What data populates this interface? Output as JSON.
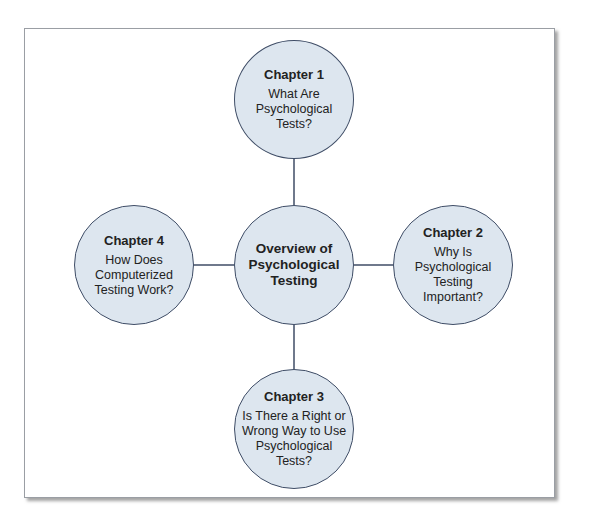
{
  "diagram": {
    "type": "hub-and-spoke concept map",
    "colors": {
      "node_fill": "#dde6ef",
      "node_border": "#3f4d66",
      "connector": "#3f4d66",
      "frame_border": "#9a9ea4",
      "text": "#222222"
    },
    "center": {
      "title": "Overview of\nPsychological\nTesting"
    },
    "nodes": [
      {
        "position": "top",
        "chapter": "Chapter 1",
        "title": "What Are\nPsychological\nTests?"
      },
      {
        "position": "right",
        "chapter": "Chapter 2",
        "title": "Why Is\nPsychological\nTesting\nImportant?"
      },
      {
        "position": "bottom",
        "chapter": "Chapter 3",
        "title": "Is There a Right or\nWrong Way to Use\nPsychological\nTests?"
      },
      {
        "position": "left",
        "chapter": "Chapter 4",
        "title": "How Does\nComputerized\nTesting Work?"
      }
    ],
    "edges": [
      {
        "from": "center",
        "to": "Chapter 1"
      },
      {
        "from": "center",
        "to": "Chapter 2"
      },
      {
        "from": "center",
        "to": "Chapter 3"
      },
      {
        "from": "center",
        "to": "Chapter 4"
      }
    ]
  }
}
